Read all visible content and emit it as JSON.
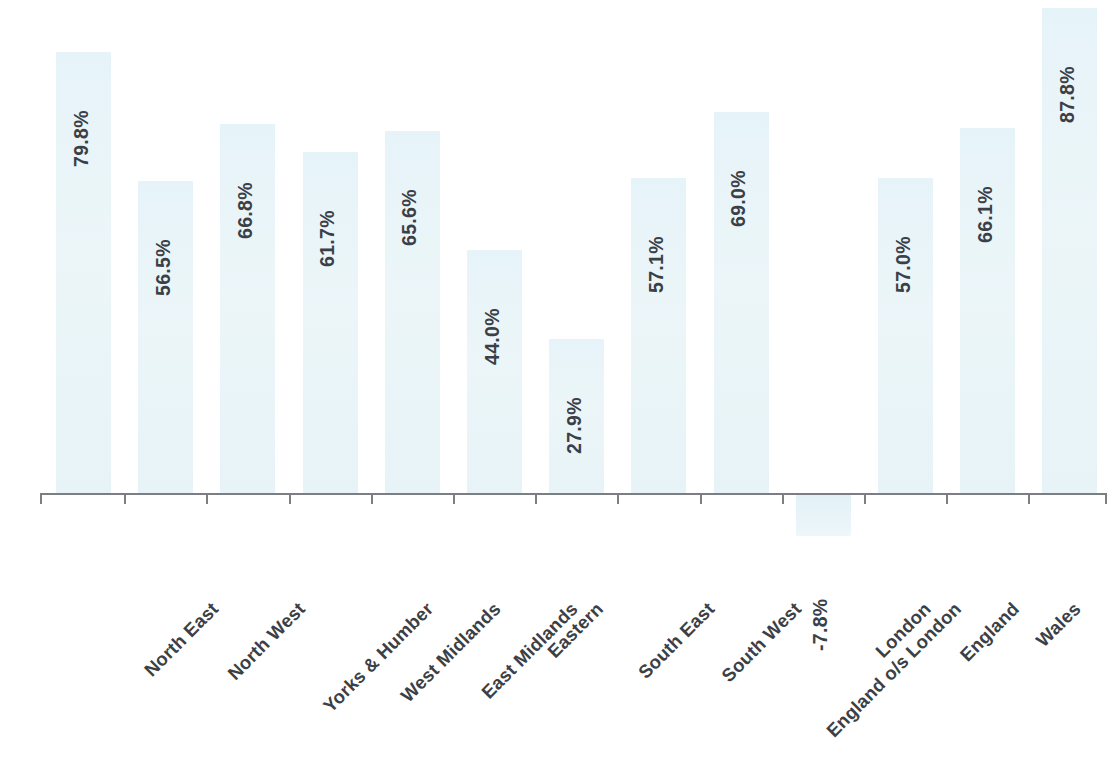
{
  "chart_data": {
    "type": "bar",
    "title": "",
    "subtitle": "",
    "xlabel": "",
    "ylabel": "",
    "grid": false,
    "legend": false,
    "value_suffix": "%",
    "bar_color": "#e9f4f8",
    "label_color": "#3b3f47",
    "axis_color": "#7b7f85",
    "ylim": [
      -7.8,
      87.8
    ],
    "categories": [
      "North East",
      "North West",
      "Yorks & Humber",
      "West Midlands",
      "East Midlands",
      "Eastern",
      "South East",
      "South West",
      "England o/s London",
      "London",
      "England",
      "Wales",
      "Scotland"
    ],
    "values": [
      79.8,
      56.5,
      66.8,
      61.7,
      65.6,
      44.0,
      27.9,
      57.1,
      69.0,
      -7.8,
      57.0,
      66.1,
      87.8
    ],
    "data_labels": [
      "79.8%",
      "56.5%",
      "66.8%",
      "61.7%",
      "65.6%",
      "44.0%",
      "27.9%",
      "57.1%",
      "69.0%",
      "-7.8%",
      "57.0%",
      "66.1%",
      "87.8%"
    ]
  }
}
